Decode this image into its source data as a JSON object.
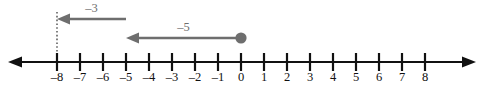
{
  "figure": {
    "colors": {
      "axis": "#111111",
      "label": "#111111",
      "arrow": "#6e6e6e",
      "guide": "#4a4a4a",
      "background": "#ffffff"
    }
  },
  "chart_data": {
    "type": "number_line",
    "title": "",
    "xlabel": "",
    "ylabel": "",
    "xlim": [
      -8,
      8
    ],
    "tick_step": 1,
    "grid": false,
    "legend": null,
    "tick_values": [
      -8,
      -7,
      -6,
      -5,
      -4,
      -3,
      -2,
      -1,
      0,
      1,
      2,
      3,
      4,
      5,
      6,
      7,
      8
    ],
    "tick_labels": [
      "–8",
      "–7",
      "–6",
      "–5",
      "–4",
      "–3",
      "–2",
      "–1",
      "0",
      "1",
      "2",
      "3",
      "4",
      "5",
      "6",
      "7",
      "8"
    ],
    "axis_arrows": [
      "left",
      "right"
    ],
    "start_point": {
      "value": 0,
      "label": "0",
      "style": "filled-dot"
    },
    "jumps": [
      {
        "label": "–5",
        "value": -5,
        "from": 0,
        "to": -5,
        "direction": "left",
        "row": 2
      },
      {
        "label": "–3",
        "value": -3,
        "from": -5,
        "to": -8,
        "direction": "left",
        "row": 1
      }
    ],
    "result": -8,
    "guide": {
      "at": -8,
      "style": "dotted-vertical"
    }
  }
}
